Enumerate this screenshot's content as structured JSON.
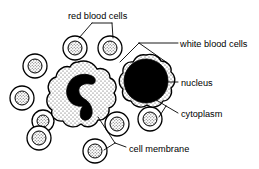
{
  "diagram": {
    "background_color": "#ffffff",
    "stroke_color": "#000000",
    "nucleus_color": "#000000",
    "cytoplasm_fill": "#f2f2f2",
    "labels": {
      "red_blood_cells": "red blood cells",
      "white_blood_cells": "white blood cells",
      "nucleus": "nucleus",
      "cytoplasm": "cytoplasm",
      "cell_membrane": "cell membrane"
    },
    "red_blood_cells": [
      {
        "id": "rbc-top-left",
        "cx": 75,
        "cy": 48,
        "r_outer": 12,
        "r_inner": 7
      },
      {
        "id": "rbc-top-right",
        "cx": 110,
        "cy": 48,
        "r_outer": 12,
        "r_inner": 7
      },
      {
        "id": "rbc-left-upper",
        "cx": 35,
        "cy": 66,
        "r_outer": 12,
        "r_inner": 7
      },
      {
        "id": "rbc-left-middle",
        "cx": 22,
        "cy": 98,
        "r_outer": 12,
        "r_inner": 7
      },
      {
        "id": "rbc-left-lower",
        "cx": 39,
        "cy": 138,
        "r_outer": 12,
        "r_inner": 7
      },
      {
        "id": "rbc-bottom-mid",
        "cx": 95,
        "cy": 151,
        "r_outer": 12,
        "r_inner": 7
      },
      {
        "id": "rbc-bottom-left",
        "cx": 43,
        "cy": 121,
        "r_outer": 11,
        "r_inner": 6
      },
      {
        "id": "rbc-center-low",
        "cx": 117,
        "cy": 124,
        "r_outer": 12,
        "r_inner": 7
      },
      {
        "id": "rbc-right-mid",
        "cx": 150,
        "cy": 119,
        "r_outer": 12,
        "r_inner": 7
      }
    ],
    "white_blood_cells": [
      {
        "id": "wbc-left",
        "type": "lobed-nucleus",
        "center": {
          "cx": 80,
          "cy": 100
        },
        "nucleus_shape": "crescent"
      },
      {
        "id": "wbc-right",
        "type": "round-nucleus",
        "center": {
          "cx": 146,
          "cy": 85
        },
        "nucleus_shape": "round",
        "nucleus_radius": 22
      }
    ],
    "leader_lines": [
      {
        "label": "red_blood_cells",
        "targets": [
          "rbc-top-left",
          "rbc-top-right"
        ]
      },
      {
        "label": "white_blood_cells",
        "targets": [
          "wbc-right",
          "wbc-left"
        ]
      },
      {
        "label": "nucleus",
        "targets": [
          "wbc-right-nucleus"
        ]
      },
      {
        "label": "cytoplasm",
        "targets": [
          "wbc-right-cytoplasm",
          "rbc-right-mid"
        ]
      },
      {
        "label": "cell_membrane",
        "targets": [
          "wbc-left-membrane",
          "rbc-bottom-mid"
        ]
      }
    ],
    "label_positions": {
      "red_blood_cells": {
        "x": 68,
        "y": 19
      },
      "white_blood_cells": {
        "x": 180,
        "y": 47
      },
      "nucleus": {
        "x": 181,
        "y": 86
      },
      "cytoplasm": {
        "x": 181,
        "y": 117
      },
      "cell_membrane": {
        "x": 129,
        "y": 152
      }
    }
  }
}
